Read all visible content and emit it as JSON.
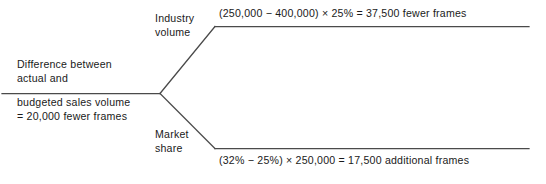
{
  "diagram": {
    "type": "variance-tree",
    "line_color": "#4a4a4a",
    "text_color": "#1a1a1a",
    "background_color": "#ffffff",
    "root": {
      "label_top": "Difference between\nactual and",
      "label_bottom": "budgeted sales volume\n= 20,000 fewer frames",
      "total": "20,000 fewer frames"
    },
    "branches": [
      {
        "key": "industry-volume",
        "name": "Industry\nvolume",
        "formula": "(250,000 − 400,000) × 25% = 37,500 fewer frames",
        "terms": {
          "actual_industry_volume": "250,000",
          "budgeted_industry_volume": "400,000",
          "budgeted_market_share": "25%",
          "result": "37,500 fewer frames"
        }
      },
      {
        "key": "market-share",
        "name": "Market\nshare",
        "formula": "(32% − 25%) × 250,000 = 17,500 additional frames",
        "terms": {
          "actual_market_share": "32%",
          "budgeted_market_share": "25%",
          "actual_industry_volume": "250,000",
          "result": "17,500 additional frames"
        }
      }
    ],
    "geometry": {
      "root_line": {
        "x1": 2,
        "y1": 93,
        "x2": 160,
        "y2": 93
      },
      "fork": {
        "x": 160,
        "y": 93
      },
      "upper_branch": {
        "x1": 160,
        "y1": 93,
        "x2": 215,
        "y2": 26
      },
      "upper_rule": {
        "x1": 215,
        "y1": 26,
        "x2": 529,
        "y2": 26
      },
      "lower_branch": {
        "x1": 160,
        "y1": 93,
        "x2": 215,
        "y2": 148
      },
      "lower_rule": {
        "x1": 215,
        "y1": 148,
        "x2": 529,
        "y2": 148
      }
    }
  }
}
